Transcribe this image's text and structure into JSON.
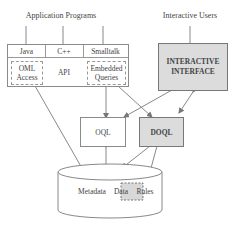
{
  "diagram": {
    "top_labels": {
      "application_programs": "Application Programs",
      "interactive_users": "Interactive Users"
    },
    "app_box": {
      "languages": [
        "Java",
        "C++",
        "Smalltalk"
      ],
      "oml_access_line1": "OML",
      "oml_access_line2": "Access",
      "api": "API",
      "embedded_line1": "Embedded",
      "embedded_line2": "Queries"
    },
    "interactive_interface": {
      "line1": "INTERACTIVE",
      "line2": "INTERFACE"
    },
    "oql": "OQL",
    "doql": "DOQL",
    "database": {
      "metadata": "Metadata",
      "data": "Data",
      "rules": "Rules"
    },
    "colors": {
      "line": "#8a8a8a",
      "shaded_fill": "#dcdcdc",
      "text": "#444444"
    }
  }
}
